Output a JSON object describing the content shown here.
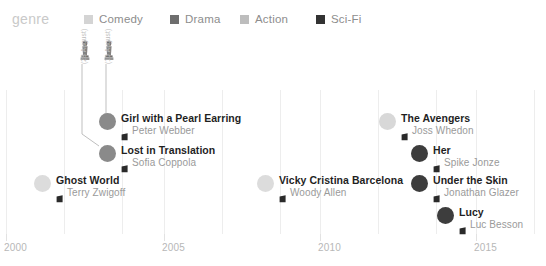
{
  "legend": {
    "title": "genre",
    "items": [
      {
        "label": "Comedy",
        "color": "#d4d4d4",
        "x": 84
      },
      {
        "label": "Drama",
        "color": "#6e6e6e",
        "x": 170
      },
      {
        "label": "Action",
        "color": "#bdbdbd",
        "x": 240
      },
      {
        "label": "Sci-Fi",
        "color": "#333333",
        "x": 316
      }
    ]
  },
  "chart_data": {
    "type": "scatter",
    "title": "genre",
    "xlabel": "",
    "ylabel": "",
    "xlim": [
      1999.2,
      2016.6
    ],
    "grid": true,
    "legend_position": "top",
    "axis": {
      "ticks": [
        {
          "label": "2000",
          "x": 6
        },
        {
          "label": "2005",
          "x": 164
        },
        {
          "label": "2010",
          "x": 320
        },
        {
          "label": "2015",
          "x": 476
        }
      ],
      "gridlines_x": [
        6,
        64,
        122,
        164,
        222,
        280,
        320,
        378,
        436,
        476,
        534
      ]
    },
    "awards": [
      {
        "name": "award-statue",
        "date_label": "(28 August)",
        "x": 78,
        "y": 6
      },
      {
        "name": "award-statue",
        "date_label": "(10 August)",
        "x": 102,
        "y": 6
      }
    ],
    "points": [
      {
        "title": "Girl with a Pearl Earring",
        "director": "Peter Webber",
        "genre": "Drama",
        "color": "#8a8a8a",
        "x": 99,
        "y": 78,
        "size": 17
      },
      {
        "title": "Lost in Translation",
        "director": "Sofia Coppola",
        "genre": "Drama",
        "color": "#8a8a8a",
        "x": 99,
        "y": 110,
        "size": 17
      },
      {
        "title": "Ghost World",
        "director": "Terry Zwigoff",
        "genre": "Comedy",
        "color": "#dcdcdc",
        "x": 34,
        "y": 140,
        "size": 17
      },
      {
        "title": "Vicky Cristina Barcelona",
        "director": "Woody Allen",
        "genre": "Comedy",
        "color": "#dcdcdc",
        "x": 257,
        "y": 140,
        "size": 17
      },
      {
        "title": "The Avengers",
        "director": "Joss Whedon",
        "genre": "Action",
        "color": "#d8d8d8",
        "x": 379,
        "y": 78,
        "size": 17
      },
      {
        "title": "Her",
        "director": "Spike Jonze",
        "genre": "Sci-Fi",
        "color": "#3d3d3d",
        "x": 411,
        "y": 110,
        "size": 17
      },
      {
        "title": "Under the Skin",
        "director": "Jonathan Glazer",
        "genre": "Sci-Fi",
        "color": "#3d3d3d",
        "x": 411,
        "y": 140,
        "size": 17
      },
      {
        "title": "Lucy",
        "director": "Luc Besson",
        "genre": "Sci-Fi",
        "color": "#3d3d3d",
        "x": 437,
        "y": 172,
        "size": 17
      }
    ]
  }
}
